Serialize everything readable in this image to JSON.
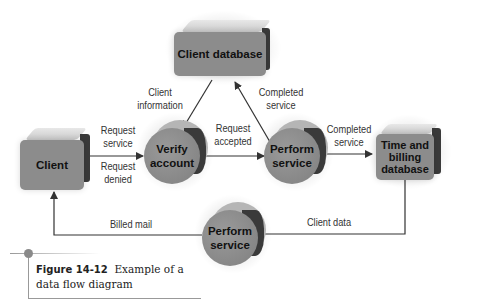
{
  "diagram": {
    "nodes": {
      "client_database": {
        "label": "Client database",
        "shape": "data-store"
      },
      "client": {
        "label": "Client",
        "shape": "external-entity"
      },
      "verify_account": {
        "label": "Verify account",
        "line1": "Verify",
        "line2": "account",
        "shape": "process"
      },
      "perform_service_1": {
        "label": "Perform service",
        "line1": "Perform",
        "line2": "service",
        "shape": "process"
      },
      "time_billing_db": {
        "label": "Time and billing database",
        "line1": "Time and",
        "line2": "billing",
        "line3": "database",
        "shape": "data-store"
      },
      "perform_service_2": {
        "label": "Perform service",
        "line1": "Perform",
        "line2": "service",
        "shape": "process"
      }
    },
    "flows": {
      "request_service": {
        "line1": "Request",
        "line2": "service",
        "from": "Client",
        "to": "Verify account"
      },
      "request_denied": {
        "line1": "Request",
        "line2": "denied",
        "from": "Verify account",
        "to": "Client"
      },
      "client_information": {
        "line1": "Client",
        "line2": "information",
        "from": "Client database",
        "to": "Verify account"
      },
      "request_accepted": {
        "line1": "Request",
        "line2": "accepted",
        "from": "Verify account",
        "to": "Perform service"
      },
      "completed_service_up": {
        "line1": "Completed",
        "line2": "service",
        "from": "Perform service",
        "to": "Client database"
      },
      "completed_service_right": {
        "line1": "Completed",
        "line2": "service",
        "from": "Perform service",
        "to": "Time and billing database"
      },
      "client_data": {
        "label": "Client data",
        "from": "Time and billing database",
        "to": "Perform service"
      },
      "billed_mail": {
        "label": "Billed mail",
        "from": "Perform service",
        "to": "Client"
      }
    },
    "colors": {
      "node_fill": "#8c8c8c",
      "node_side": "#3a3a3a",
      "node_top": "#d6d6d6",
      "line": "#333333"
    }
  },
  "caption": {
    "figure_number": "Figure 14-12",
    "line1_rest": "Example of a",
    "line2": "data flow diagram"
  }
}
